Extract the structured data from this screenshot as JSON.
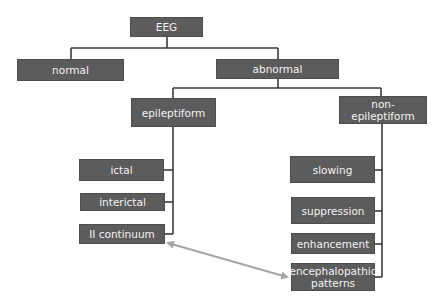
{
  "diagram": {
    "colors": {
      "node_fill": "#5c5c5c",
      "node_text": "#f2f2f2",
      "connector": "#3a3a3a",
      "arrow": "#a6a6a6",
      "background": "#ffffff"
    },
    "nodes": {
      "eeg": "EEG",
      "normal": "normal",
      "abnormal": "abnormal",
      "epileptiform": "epileptiform",
      "non_epileptiform": "non-epileptiform",
      "ictal": "ictal",
      "interictal": "interictal",
      "ii_continuum": "II continuum",
      "slowing": "slowing",
      "suppression": "suppression",
      "enhancement": "enhancement",
      "encephalopathic_line1": "encephalopathic",
      "encephalopathic_line2": "patterns"
    },
    "edges": [
      [
        "EEG",
        "normal"
      ],
      [
        "EEG",
        "abnormal"
      ],
      [
        "abnormal",
        "epileptiform"
      ],
      [
        "abnormal",
        "non-epileptiform"
      ],
      [
        "epileptiform",
        "ictal"
      ],
      [
        "epileptiform",
        "interictal"
      ],
      [
        "epileptiform",
        "II continuum"
      ],
      [
        "non-epileptiform",
        "slowing"
      ],
      [
        "non-epileptiform",
        "suppression"
      ],
      [
        "non-epileptiform",
        "enhancement"
      ],
      [
        "non-epileptiform",
        "encephalopathic patterns"
      ]
    ],
    "bidirectional_links": [
      [
        "II continuum",
        "encephalopathic patterns"
      ]
    ]
  }
}
